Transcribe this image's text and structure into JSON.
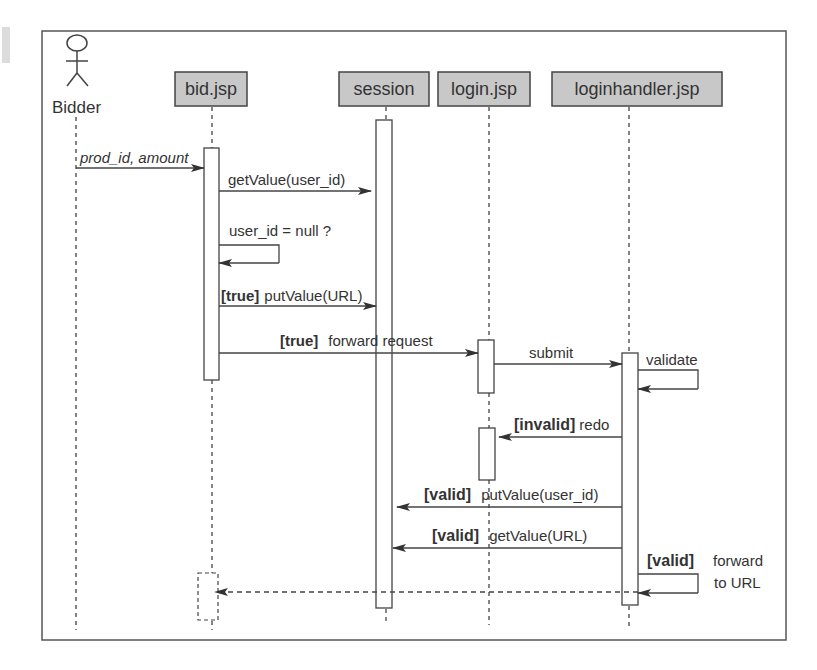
{
  "diagram": {
    "type": "sequence",
    "actor": {
      "label": "Bidder",
      "icon": "stick-figure-icon"
    },
    "participants": [
      {
        "id": "bid",
        "label": "bid.jsp"
      },
      {
        "id": "session",
        "label": "session"
      },
      {
        "id": "login",
        "label": "login.jsp"
      },
      {
        "id": "loginhandler",
        "label": "loginhandler.jsp"
      }
    ],
    "messages": [
      {
        "from": "Bidder",
        "to": "bid.jsp",
        "label": "prod_id, amount",
        "style": "italic"
      },
      {
        "from": "bid.jsp",
        "to": "session",
        "label": "getValue(user_id)"
      },
      {
        "from": "bid.jsp",
        "to": "bid.jsp",
        "label": "user_id = null ?"
      },
      {
        "from": "bid.jsp",
        "to": "session",
        "guard": "[true]",
        "label": "putValue(URL)"
      },
      {
        "from": "bid.jsp",
        "to": "login.jsp",
        "guard": "[true]",
        "label": "forward request"
      },
      {
        "from": "login.jsp",
        "to": "loginhandler.jsp",
        "label": "submit"
      },
      {
        "from": "loginhandler.jsp",
        "to": "loginhandler.jsp",
        "label": "validate"
      },
      {
        "from": "loginhandler.jsp",
        "to": "login.jsp",
        "guard": "[invalid]",
        "label": "redo"
      },
      {
        "from": "loginhandler.jsp",
        "to": "session",
        "guard": "[valid]",
        "label": "putValue(user_id)"
      },
      {
        "from": "loginhandler.jsp",
        "to": "session",
        "guard": "[valid]",
        "label": "getValue(URL)"
      },
      {
        "from": "loginhandler.jsp",
        "to": "loginhandler.jsp",
        "guard": "[valid]",
        "label_line1": "forward",
        "label_line2": "to URL"
      },
      {
        "from": "loginhandler.jsp",
        "to": "bid.jsp",
        "label": "",
        "style": "dashed-return"
      }
    ]
  }
}
